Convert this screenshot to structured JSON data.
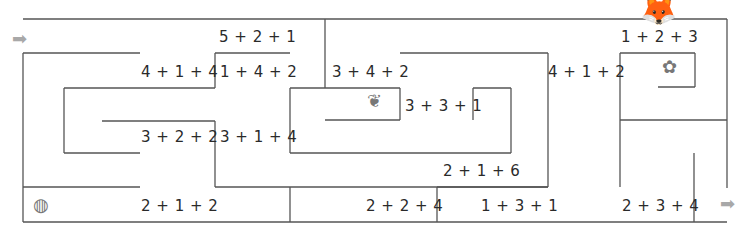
{
  "colors": {
    "wall": "#555555",
    "arrow": "#a8a8a8",
    "text": "#2a2a2a"
  },
  "start_arrow": {
    "x": 12,
    "y": 30,
    "glyph": "➡"
  },
  "end_arrow": {
    "x": 720,
    "y": 197,
    "glyph": "➡"
  },
  "expressions": [
    {
      "text": "5 + 2 + 1",
      "x": 219,
      "y": 28
    },
    {
      "text": "4 + 1 + 4",
      "x": 141,
      "y": 63
    },
    {
      "text": "1 + 4 + 2",
      "x": 220,
      "y": 63
    },
    {
      "text": "3 + 4 + 2",
      "x": 332,
      "y": 63
    },
    {
      "text": "4 + 1 + 2",
      "x": 548,
      "y": 63
    },
    {
      "text": "1 + 2 + 3",
      "x": 621,
      "y": 28
    },
    {
      "text": "3 + 3 + 1",
      "x": 405,
      "y": 97
    },
    {
      "text": "3 + 2 + 2",
      "x": 141,
      "y": 128
    },
    {
      "text": "3 + 1 + 4",
      "x": 220,
      "y": 128
    },
    {
      "text": "2 + 1 + 6",
      "x": 443,
      "y": 162
    },
    {
      "text": "2 + 1 + 2",
      "x": 141,
      "y": 197
    },
    {
      "text": "2 + 2 + 4",
      "x": 366,
      "y": 197
    },
    {
      "text": "1 + 3 + 1",
      "x": 481,
      "y": 197
    },
    {
      "text": "2 + 3 + 4",
      "x": 622,
      "y": 197
    }
  ],
  "icons": [
    {
      "name": "fox-icon",
      "glyph": "🦊",
      "x": 640,
      "y": -8
    },
    {
      "name": "flower-icon",
      "glyph": "✿",
      "x": 662,
      "y": 56
    },
    {
      "name": "leaf-icon",
      "glyph": "❦",
      "x": 367,
      "y": 90
    },
    {
      "name": "ball-icon",
      "glyph": "◍",
      "x": 33,
      "y": 194
    }
  ],
  "walls": [
    [
      23,
      19,
      727,
      19
    ],
    [
      727,
      19,
      727,
      188
    ],
    [
      325,
      19,
      325,
      88
    ],
    [
      23,
      53,
      140,
      53
    ],
    [
      23,
      53,
      23,
      222
    ],
    [
      215,
      53,
      290,
      53
    ],
    [
      215,
      53,
      215,
      88
    ],
    [
      64,
      88,
      215,
      88
    ],
    [
      64,
      88,
      64,
      153
    ],
    [
      64,
      153,
      140,
      153
    ],
    [
      290,
      88,
      400,
      88
    ],
    [
      290,
      88,
      290,
      153
    ],
    [
      400,
      88,
      400,
      120
    ],
    [
      325,
      120,
      400,
      120
    ],
    [
      473,
      88,
      511,
      88
    ],
    [
      473,
      88,
      473,
      120
    ],
    [
      511,
      88,
      511,
      153
    ],
    [
      290,
      153,
      511,
      153
    ],
    [
      102,
      121,
      215,
      121
    ],
    [
      215,
      121,
      215,
      187
    ],
    [
      215,
      187,
      548,
      187
    ],
    [
      548,
      53,
      548,
      187
    ],
    [
      400,
      53,
      548,
      53
    ],
    [
      23,
      187,
      140,
      187
    ],
    [
      290,
      187,
      290,
      222
    ],
    [
      437,
      187,
      437,
      222
    ],
    [
      437,
      187,
      548,
      187
    ],
    [
      620,
      53,
      695,
      53
    ],
    [
      620,
      53,
      620,
      187
    ],
    [
      695,
      53,
      695,
      87
    ],
    [
      658,
      87,
      695,
      87
    ],
    [
      620,
      120,
      727,
      120
    ],
    [
      694,
      153,
      694,
      222
    ],
    [
      23,
      222,
      727,
      222
    ]
  ]
}
